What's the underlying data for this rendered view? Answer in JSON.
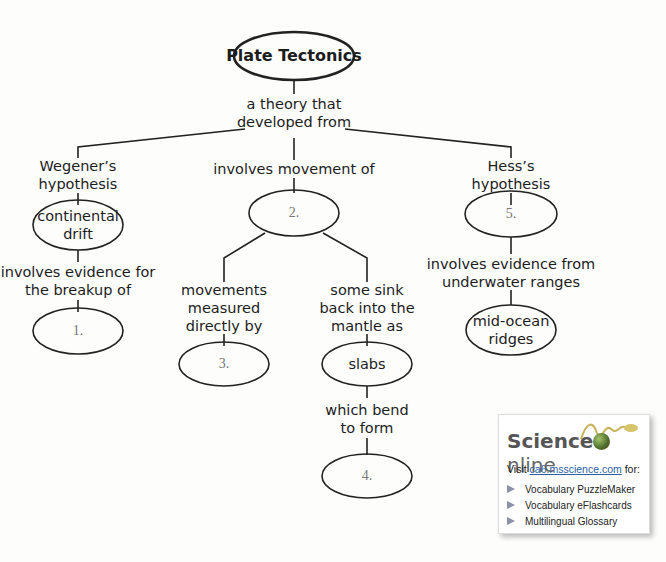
{
  "concept_map": {
    "root": "Plate Tectonics",
    "root_link": "a theory that\ndeveloped from",
    "left": {
      "label": "Wegener’s\nhypothesis",
      "node": "continental\ndrift",
      "link": "involves evidence for\nthe breakup of",
      "blank": "1."
    },
    "center": {
      "link": "involves movement of",
      "blank": "2.",
      "left_branch": {
        "link": "movements\nmeasured\ndirectly by",
        "blank": "3."
      },
      "right_branch": {
        "link": "some sink\nback into the\nmantle as",
        "node": "slabs",
        "link2": "which bend\nto form",
        "blank": "4."
      }
    },
    "right": {
      "label": "Hess’s\nhypothesis",
      "blank": "5.",
      "link": "involves evidence from\nunderwater ranges",
      "node": "mid-ocean\nridges"
    }
  },
  "science_online": {
    "logo_science": "Science",
    "logo_online": "nline",
    "visit_prefix": "Visit ",
    "visit_link": "ca6.msscience.com",
    "visit_suffix": " for:",
    "items": [
      "Vocabulary PuzzleMaker",
      "Vocabulary eFlashcards",
      "Multilingual Glossary"
    ]
  }
}
